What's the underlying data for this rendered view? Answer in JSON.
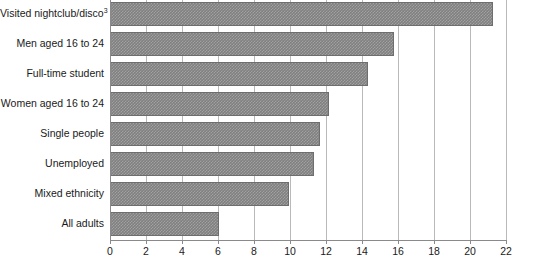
{
  "chart_data": {
    "type": "bar",
    "orientation": "horizontal",
    "title": "",
    "xlabel": "",
    "ylabel": "",
    "xlim": [
      0,
      22
    ],
    "xticks": [
      0,
      2,
      4,
      6,
      8,
      10,
      12,
      14,
      16,
      18,
      20,
      22
    ],
    "grid": true,
    "legend": false,
    "bar_color": "#808080",
    "bar_pattern": "checkered-dither",
    "categories": [
      "Visited nightclub/disco",
      "Men aged 16 to 24",
      "Full-time student",
      "Women aged 16 to 24",
      "Single people",
      "Unemployed",
      "Mixed ethnicity",
      "All adults"
    ],
    "category_labels": [
      "Visited nightclub/disco<sup>3</sup>",
      "Men aged 16 to 24",
      "Full-time student",
      "Women aged 16 to 24",
      "Single people",
      "Unemployed",
      "Mixed ethnicity",
      "All adults"
    ],
    "footnote_markers": {
      "Visited nightclub/disco": "3"
    },
    "values": [
      21.2,
      15.7,
      14.3,
      12.1,
      11.6,
      11.3,
      9.9,
      6.0
    ]
  },
  "axis": {
    "tick_labels": [
      "0",
      "2",
      "4",
      "6",
      "8",
      "10",
      "12",
      "14",
      "16",
      "18",
      "20",
      "22"
    ]
  },
  "colors": {
    "bar": "#808080",
    "bar_edge": "#6e6e6e",
    "gridline": "#b9b9b9",
    "axis": "#8a8a8a",
    "text": "#1a1a1a",
    "background": "#ffffff"
  }
}
